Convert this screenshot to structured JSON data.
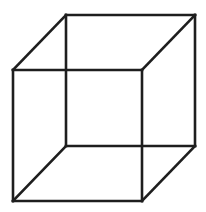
{
  "figure": {
    "type": "necker-cube",
    "background": "#ffffff",
    "stroke_color": "#1e1e1e",
    "stroke_width": 2.6,
    "back_face": {
      "top_left": [
        66,
        15
      ],
      "top_right": [
        195,
        15
      ],
      "bottom_right": [
        195,
        146
      ],
      "bottom_left": [
        66,
        146
      ]
    },
    "front_face": {
      "top_left": [
        13,
        70
      ],
      "top_right": [
        142,
        70
      ],
      "bottom_right": [
        142,
        201
      ],
      "bottom_left": [
        13,
        201
      ]
    }
  }
}
